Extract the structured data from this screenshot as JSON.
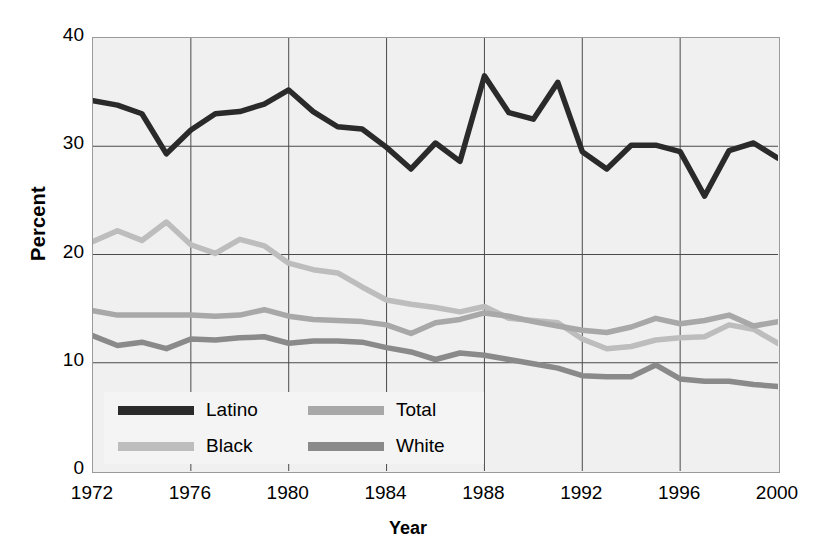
{
  "chart_data": {
    "type": "line",
    "title": "",
    "xlabel": "Year",
    "ylabel": "Percent",
    "xlim": [
      1972,
      2000
    ],
    "ylim": [
      0,
      40
    ],
    "ytick_values": [
      0,
      10,
      20,
      30,
      40
    ],
    "xtick_values": [
      1972,
      1976,
      1980,
      1984,
      1988,
      1992,
      1996,
      2000
    ],
    "ytick_labels": [
      "0",
      "10",
      "20",
      "30",
      "40"
    ],
    "xtick_labels": [
      "1972",
      "1976",
      "1980",
      "1984",
      "1988",
      "1992",
      "1996",
      "2000"
    ],
    "grid": true,
    "grid_color": "#4a4a4a",
    "plot_background": "#f0f0f0",
    "legend_position": "lower-left-inside",
    "x": [
      1972,
      1973,
      1974,
      1975,
      1976,
      1977,
      1978,
      1979,
      1980,
      1981,
      1982,
      1983,
      1984,
      1985,
      1986,
      1987,
      1988,
      1989,
      1990,
      1991,
      1992,
      1993,
      1994,
      1995,
      1996,
      1997,
      1998,
      1999,
      2000
    ],
    "series": [
      {
        "name": "Latino",
        "color": "#2a2a2a",
        "values": [
          34.2,
          33.8,
          33.0,
          29.3,
          31.5,
          33.0,
          33.2,
          33.9,
          35.2,
          33.2,
          31.8,
          31.6,
          29.9,
          27.9,
          30.3,
          28.6,
          36.5,
          33.1,
          32.5,
          35.9,
          29.5,
          27.9,
          30.1,
          30.1,
          29.5,
          25.4,
          29.6,
          30.3,
          28.9
        ]
      },
      {
        "name": "Black",
        "color": "#bdbdbd",
        "values": [
          21.2,
          22.2,
          21.3,
          23.0,
          20.9,
          20.1,
          21.4,
          20.8,
          19.2,
          18.6,
          18.3,
          17.0,
          15.8,
          15.4,
          15.1,
          14.7,
          15.2,
          14.1,
          13.9,
          13.7,
          12.2,
          11.3,
          11.5,
          12.1,
          12.3,
          12.4,
          13.5,
          13.1,
          11.8
        ]
      },
      {
        "name": "Total",
        "color": "#a8a8a8",
        "values": [
          14.8,
          14.4,
          14.4,
          14.4,
          14.4,
          14.3,
          14.4,
          14.9,
          14.3,
          14.0,
          13.9,
          13.8,
          13.5,
          12.7,
          13.7,
          14.0,
          14.6,
          14.3,
          13.8,
          13.4,
          13.0,
          12.8,
          13.3,
          14.1,
          13.6,
          13.9,
          14.4,
          13.4,
          13.8
        ]
      },
      {
        "name": "White",
        "color": "#8a8a8a",
        "values": [
          12.5,
          11.6,
          11.9,
          11.3,
          12.2,
          12.1,
          12.3,
          12.4,
          11.8,
          12.0,
          12.0,
          11.9,
          11.4,
          11.0,
          10.3,
          10.9,
          10.7,
          10.3,
          9.9,
          9.5,
          8.8,
          8.7,
          8.7,
          9.8,
          8.5,
          8.3,
          8.3,
          8.0,
          7.8
        ]
      }
    ]
  },
  "legend": {
    "entries": [
      {
        "label": "Latino",
        "color": "#2a2a2a"
      },
      {
        "label": "Total",
        "color": "#a8a8a8"
      },
      {
        "label": "Black",
        "color": "#bdbdbd"
      },
      {
        "label": "White",
        "color": "#8a8a8a"
      }
    ]
  }
}
